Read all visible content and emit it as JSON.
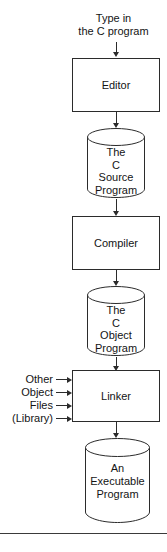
{
  "diagram": {
    "title_caption": {
      "line1": "Type in",
      "line2": "the C program"
    },
    "steps": [
      {
        "id": "editor",
        "label": "Editor",
        "shape": "process"
      },
      {
        "id": "compiler",
        "label": "Compiler",
        "shape": "process"
      },
      {
        "id": "linker",
        "label": "Linker",
        "shape": "process"
      }
    ],
    "stores": [
      {
        "id": "c-source-program",
        "shape": "cylinder",
        "lines": [
          "The",
          "C",
          "Source",
          "Program"
        ]
      },
      {
        "id": "c-object-program",
        "shape": "cylinder",
        "lines": [
          "The",
          "C",
          "Object",
          "Program"
        ]
      },
      {
        "id": "executable-program",
        "shape": "cylinder",
        "lines": [
          "An",
          "Executable",
          "Program"
        ]
      }
    ],
    "linker_inputs": [
      {
        "label": "Other"
      },
      {
        "label": "Object"
      },
      {
        "label": "Files"
      },
      {
        "label": "(Library)"
      }
    ],
    "colors": {
      "stroke": "#2b2b2b",
      "text": "#141414",
      "background": "#ffffff",
      "rule": "#3a3a3a"
    }
  }
}
